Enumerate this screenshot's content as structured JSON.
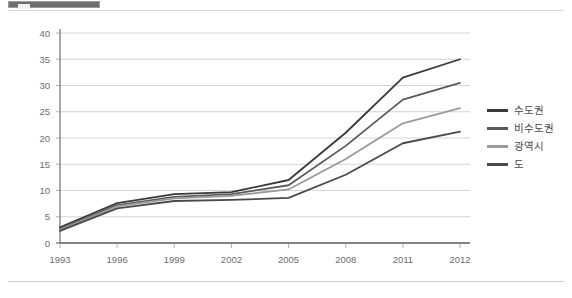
{
  "header": {
    "marker_label": "",
    "marker_color": "#6f6f71"
  },
  "chart_data": {
    "type": "line",
    "title": "",
    "xlabel": "",
    "ylabel": "",
    "categories": [
      "1993",
      "1996",
      "1999",
      "2002",
      "2005",
      "2008",
      "2011",
      "2012"
    ],
    "ylim": [
      0,
      40
    ],
    "yticks": [
      0,
      5,
      10,
      15,
      20,
      25,
      30,
      35,
      40
    ],
    "ytick_labels": [
      "0",
      "5",
      "10",
      "15",
      "20",
      "25",
      "30",
      "35",
      "40"
    ],
    "grid": true,
    "grid_axis": "y",
    "legend_position": "right",
    "series": [
      {
        "name": "수도권",
        "color": "#3a3a3c",
        "values": [
          3.0,
          7.6,
          9.3,
          9.7,
          12.0,
          21.0,
          31.5,
          35.0
        ]
      },
      {
        "name": "비수도권",
        "color": "#5a5a5c",
        "values": [
          2.7,
          7.2,
          8.8,
          9.3,
          11.0,
          18.5,
          27.3,
          30.5
        ]
      },
      {
        "name": "광역시",
        "color": "#9a9a9c",
        "values": [
          2.5,
          7.0,
          8.5,
          9.0,
          10.2,
          16.0,
          22.8,
          25.7
        ]
      },
      {
        "name": "도",
        "color": "#4a4a4c",
        "values": [
          2.3,
          6.6,
          8.0,
          8.2,
          8.6,
          13.0,
          19.0,
          21.2
        ]
      }
    ]
  },
  "legend": {
    "items": [
      {
        "label": "수도권",
        "color": "#3a3a3c"
      },
      {
        "label": "비수도권",
        "color": "#5a5a5c"
      },
      {
        "label": "광역시",
        "color": "#9a9a9c"
      },
      {
        "label": "도",
        "color": "#4a4a4c"
      }
    ]
  }
}
